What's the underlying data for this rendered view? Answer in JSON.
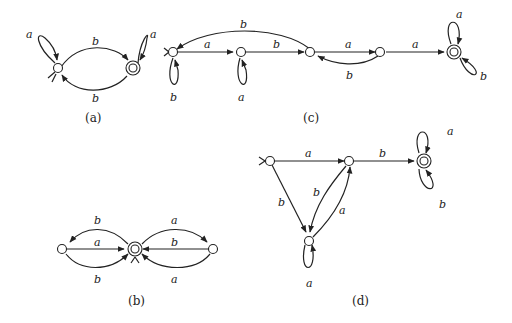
{
  "captions": {
    "a": "(a)",
    "b": "(b)",
    "c": "(c)",
    "d": "(d)"
  },
  "diagram_a": {
    "loop_start": "a",
    "loop_final": "a",
    "top": "b",
    "bottom": "b"
  },
  "diagram_b": {
    "left_top": "b",
    "left_mid": "a",
    "left_bot": "b",
    "right_top": "a",
    "right_mid": "b",
    "right_bot": "a"
  },
  "diagram_c": {
    "arc_back_top": "b",
    "s0_s1": "a",
    "s1_s2": "b",
    "s2_s3": "a",
    "s3_s2": "b",
    "s3_f": "a",
    "loop_s0": "b",
    "loop_s1": "a",
    "loop_f_top": "a",
    "loop_f_bot": "b"
  },
  "diagram_d": {
    "s0_s1": "a",
    "s1_f": "b",
    "s0_s2": "b",
    "s1_s2": "b",
    "s2_s1": "a",
    "loop_s2": "a",
    "loop_f_top": "a",
    "loop_f_bot": "b"
  }
}
